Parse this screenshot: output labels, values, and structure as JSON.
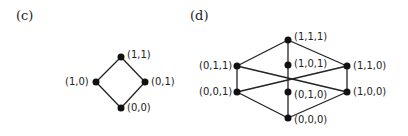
{
  "panels": [
    {
      "label": "(c)",
      "nodes": [
        {
          "id": "11",
          "text": "(1,1)",
          "x": 121,
          "y": 57,
          "lx": 127,
          "ly": 49
        },
        {
          "id": "10",
          "text": "(1,0)",
          "x": 96,
          "y": 82,
          "lx": 65,
          "ly": 76
        },
        {
          "id": "01",
          "text": "(0,1)",
          "x": 145,
          "y": 82,
          "lx": 151,
          "ly": 76
        },
        {
          "id": "00",
          "text": "(0,0)",
          "x": 121,
          "y": 108,
          "lx": 127,
          "ly": 102
        }
      ],
      "edges": [
        [
          "11",
          "10"
        ],
        [
          "11",
          "01"
        ],
        [
          "10",
          "00"
        ],
        [
          "01",
          "00"
        ]
      ]
    },
    {
      "label": "(d)",
      "nodes": [
        {
          "id": "111",
          "text": "(1,1,1)",
          "x": 288,
          "y": 40,
          "lx": 294,
          "ly": 31
        },
        {
          "id": "011",
          "text": "(0,1,1)",
          "x": 237,
          "y": 66,
          "lx": 199,
          "ly": 60
        },
        {
          "id": "101",
          "text": "(1,0,1)",
          "x": 288,
          "y": 65,
          "lx": 294,
          "ly": 58
        },
        {
          "id": "110",
          "text": "(1,1,0)",
          "x": 347,
          "y": 66,
          "lx": 353,
          "ly": 60
        },
        {
          "id": "001",
          "text": "(0,0,1)",
          "x": 237,
          "y": 92,
          "lx": 199,
          "ly": 86
        },
        {
          "id": "010",
          "text": "(0,1,0)",
          "x": 288,
          "y": 92,
          "lx": 294,
          "ly": 89
        },
        {
          "id": "100",
          "text": "(1,0,0)",
          "x": 347,
          "y": 92,
          "lx": 353,
          "ly": 86
        },
        {
          "id": "000",
          "text": "(0,0,0)",
          "x": 288,
          "y": 118,
          "lx": 294,
          "ly": 114
        }
      ],
      "edges": [
        [
          "111",
          "011"
        ],
        [
          "111",
          "101"
        ],
        [
          "111",
          "110"
        ],
        [
          "011",
          "001"
        ],
        [
          "011",
          "100"
        ],
        [
          "001",
          "110"
        ],
        [
          "101",
          "010"
        ],
        [
          "110",
          "100"
        ],
        [
          "001",
          "000"
        ],
        [
          "010",
          "000"
        ],
        [
          "100",
          "000"
        ]
      ]
    }
  ]
}
